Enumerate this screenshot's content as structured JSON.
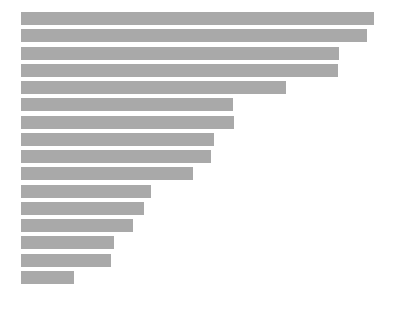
{
  "chart_data": {
    "type": "bar",
    "orientation": "horizontal",
    "title": "",
    "subtitle": "",
    "xlabel": "",
    "ylabel": "",
    "legend": [],
    "legend_position": "none",
    "grid": false,
    "axis_visible": false,
    "tick_labels_x": [],
    "tick_labels_y": [],
    "categories": [
      "1",
      "2",
      "3",
      "4",
      "5",
      "6",
      "7",
      "8",
      "9",
      "10",
      "11",
      "12",
      "13",
      "14",
      "15",
      "16"
    ],
    "values": [
      357,
      350,
      321,
      320,
      268,
      214,
      215,
      195,
      192,
      174,
      131,
      124,
      113,
      94,
      91,
      54
    ],
    "xlim": [
      0,
      374
    ],
    "bar_color": "#a9a9a9",
    "background_color": "#ffffff",
    "bar_count": 16
  },
  "layout": {
    "plot_left": 21,
    "plot_top": 12,
    "bar_height": 13,
    "bar_pitch": 17.25,
    "canvas_width": 395,
    "canvas_height": 310
  }
}
